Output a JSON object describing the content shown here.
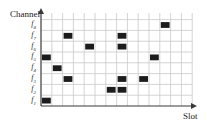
{
  "diagram": {
    "y_axis_label": "Channel",
    "x_axis_label": "Slot",
    "num_slots": 14,
    "channels": [
      {
        "id": "f1",
        "base": "f",
        "sub": "1"
      },
      {
        "id": "f2",
        "base": "f",
        "sub": "2"
      },
      {
        "id": "f3",
        "base": "f",
        "sub": "3"
      },
      {
        "id": "f4",
        "base": "f",
        "sub": "4"
      },
      {
        "id": "f5",
        "base": "f",
        "sub": "5"
      },
      {
        "id": "f6",
        "base": "f",
        "sub": "6"
      },
      {
        "id": "f7",
        "base": "f",
        "sub": "7"
      },
      {
        "id": "f8",
        "base": "f",
        "sub": "8"
      }
    ],
    "occupied_cells": [
      {
        "channel": 1,
        "slot": 1
      },
      {
        "channel": 2,
        "slot": 7
      },
      {
        "channel": 2,
        "slot": 8
      },
      {
        "channel": 3,
        "slot": 3
      },
      {
        "channel": 3,
        "slot": 8
      },
      {
        "channel": 3,
        "slot": 10
      },
      {
        "channel": 4,
        "slot": 2
      },
      {
        "channel": 5,
        "slot": 1
      },
      {
        "channel": 5,
        "slot": 11
      },
      {
        "channel": 6,
        "slot": 5
      },
      {
        "channel": 6,
        "slot": 8
      },
      {
        "channel": 7,
        "slot": 3
      },
      {
        "channel": 7,
        "slot": 8
      },
      {
        "channel": 8,
        "slot": 12
      }
    ],
    "colors": {
      "cell_fill": "#1c1c1c",
      "grid_line": "#c9c9c9",
      "axis": "#3a3a3a"
    }
  }
}
